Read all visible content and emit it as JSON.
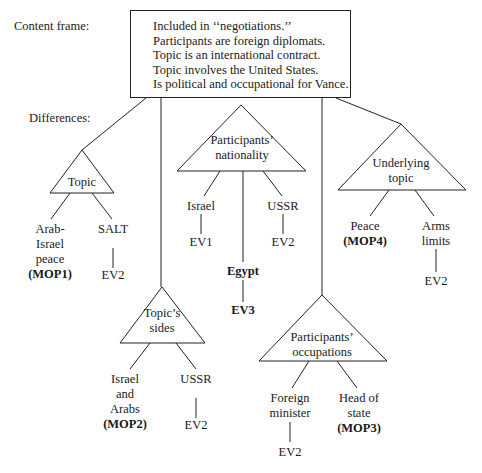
{
  "labels": {
    "content_frame": "Content frame:",
    "differences": "Differences:"
  },
  "content_frame": {
    "lines": [
      "Included in ‘‘negotiations.’’",
      "Participants are foreign diplomats.",
      "Topic is an international contract.",
      "Topic involves the United States.",
      "Is political and occupational for Vance."
    ]
  },
  "differences": {
    "topic": {
      "label": "Topic",
      "children": [
        {
          "lines": [
            "Arab-",
            "Israel",
            "peace"
          ],
          "tag": "(MOP1)"
        },
        {
          "lines": [
            "SALT"
          ],
          "event": "EV2"
        }
      ]
    },
    "topics_sides": {
      "label_lines": [
        "Topic’s",
        "sides"
      ],
      "children": [
        {
          "lines": [
            "Israel",
            "and",
            "Arabs"
          ],
          "tag": "(MOP2)"
        },
        {
          "lines": [
            "USSR"
          ],
          "event": "EV2"
        }
      ]
    },
    "participants_nationality": {
      "label_lines": [
        "Participants’",
        "nationality"
      ],
      "children": [
        {
          "lines": [
            "Israel"
          ],
          "event": "EV1"
        },
        {
          "lines": [
            "Egypt"
          ],
          "event": "EV3",
          "bold": true
        },
        {
          "lines": [
            "USSR"
          ],
          "event": "EV2"
        }
      ]
    },
    "participants_occupations": {
      "label_lines": [
        "Participants’",
        "occupations"
      ],
      "children": [
        {
          "lines": [
            "Foreign",
            "minister"
          ],
          "event": "EV2"
        },
        {
          "lines": [
            "Head of",
            "state"
          ],
          "tag": "(MOP3)"
        }
      ]
    },
    "underlying_topic": {
      "label_lines": [
        "Underlying",
        "topic"
      ],
      "children": [
        {
          "lines": [
            "Peace"
          ],
          "tag": "(MOP4)"
        },
        {
          "lines": [
            "Arms",
            "limits"
          ],
          "event": "EV2"
        }
      ]
    }
  }
}
